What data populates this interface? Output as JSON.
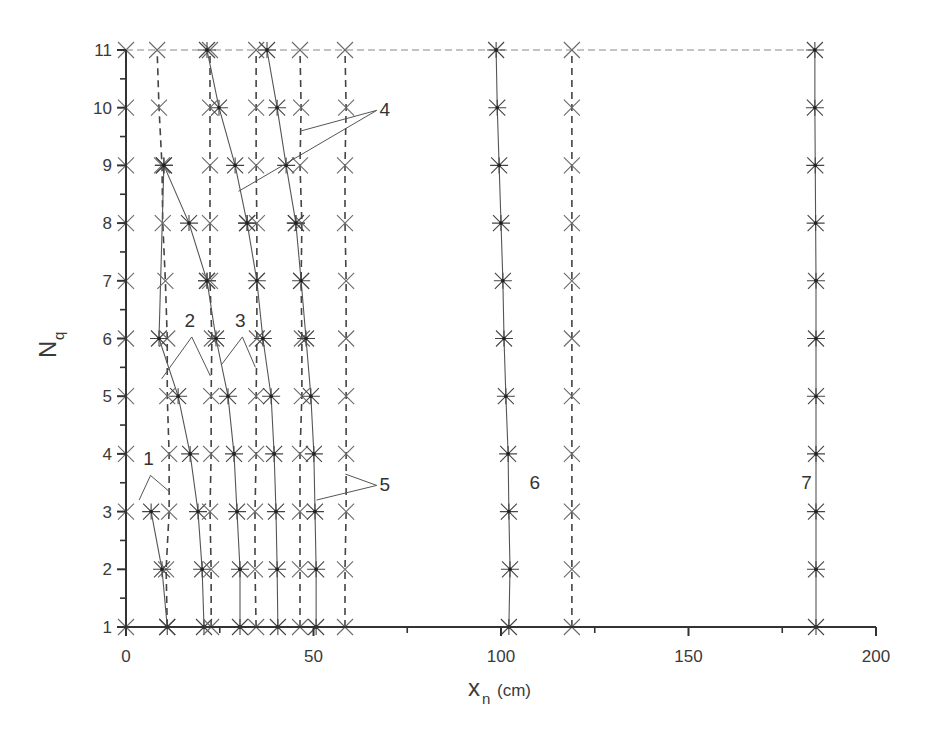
{
  "chart_data": {
    "type": "scatter",
    "title": "",
    "xlabel": "x_n (cm)",
    "xlabel_main": "x",
    "xlabel_sub": "n",
    "xlabel_unit": "(cm)",
    "ylabel": "N_q",
    "ylabel_main": "N",
    "ylabel_sub": "q",
    "xlim": [
      0,
      200
    ],
    "ylim": [
      1,
      11
    ],
    "x_ticks": [
      0,
      50,
      100,
      150,
      200
    ],
    "x_tick_labels": [
      "0",
      "50",
      "100",
      "150",
      "200"
    ],
    "x_minor_ticks": [
      25,
      75,
      125,
      175
    ],
    "y_ticks": [
      1,
      2,
      3,
      4,
      5,
      6,
      7,
      8,
      9,
      10,
      11
    ],
    "y_tick_labels": [
      "1",
      "2",
      "3",
      "4",
      "5",
      "6",
      "7",
      "8",
      "9",
      "10",
      "11"
    ],
    "grid": false,
    "legend": null,
    "y": [
      1,
      2,
      3,
      4,
      5,
      6,
      7,
      8,
      9,
      10,
      11
    ],
    "series": [
      {
        "name": "1 (x, dashed)",
        "marker": "x",
        "line": "dashed",
        "values": [
          11,
          10.7,
          11.5,
          11.5,
          11,
          11,
          10.5,
          9.8,
          9.6,
          8.8,
          8.3
        ]
      },
      {
        "name": "1 (*, solid)",
        "marker": "*",
        "line": "solid",
        "values": [
          11,
          9.6,
          6.7,
          null,
          null,
          null,
          null,
          null,
          null,
          null,
          null
        ]
      },
      {
        "name": "1-2 (x, axis)",
        "marker": "x",
        "line": "dashed",
        "values": [
          0,
          null,
          0,
          0,
          0,
          0,
          0,
          0,
          0,
          0,
          0
        ]
      },
      {
        "name": "2 (*, solid)",
        "marker": "*",
        "line": "solid",
        "values": [
          20.8,
          20.3,
          19.2,
          17.1,
          13.9,
          8.8,
          null,
          null,
          10.1,
          null,
          null
        ]
      },
      {
        "name": "2b (*, solid)",
        "marker": "*",
        "line": "solid",
        "values": [
          null,
          null,
          null,
          null,
          null,
          null,
          21.6,
          16.8,
          10.1,
          null,
          null
        ]
      },
      {
        "name": "2 (x, dashed)",
        "marker": "x",
        "line": "dashed",
        "values": [
          22.7,
          22.7,
          22.4,
          22.7,
          22.7,
          22.9,
          22.4,
          22.4,
          22.4,
          22.4,
          22.4
        ]
      },
      {
        "name": "3 (*, solid)",
        "marker": "*",
        "line": "solid",
        "values": [
          30.4,
          30.4,
          29.6,
          28.8,
          27.2,
          24.0,
          21.6,
          null,
          null,
          null,
          null
        ]
      },
      {
        "name": "4a (*, solid)",
        "marker": "*",
        "line": "solid",
        "values": [
          null,
          null,
          null,
          null,
          null,
          null,
          null,
          32.3,
          29.1,
          24.8,
          21.6
        ]
      },
      {
        "name": "3 (x, dashed)",
        "marker": "x",
        "line": "dashed",
        "values": [
          34.7,
          34.4,
          34.4,
          34.7,
          34.7,
          34.9,
          34.9,
          34.9,
          34.7,
          34.7,
          34.7
        ]
      },
      {
        "name": "4 (*, solid)",
        "marker": "*",
        "line": "solid",
        "values": [
          40.5,
          40.3,
          40.0,
          39.5,
          38.7,
          36.5,
          34.9,
          32.3,
          null,
          null,
          null
        ]
      },
      {
        "name": "4b (*, solid)",
        "marker": "*",
        "line": "solid",
        "values": [
          null,
          null,
          null,
          null,
          null,
          null,
          null,
          45.3,
          42.7,
          40.3,
          37.6
        ]
      },
      {
        "name": "4 (x, dashed)",
        "marker": "x",
        "line": "dashed",
        "values": [
          46.4,
          46.4,
          46.4,
          46.4,
          46.9,
          46.9,
          46.7,
          46.9,
          46.4,
          46.7,
          46.4
        ]
      },
      {
        "name": "5 (*, solid)",
        "marker": "*",
        "line": "solid",
        "values": [
          50.7,
          50.7,
          50.4,
          50.1,
          49.3,
          48.0,
          46.7,
          45.3,
          null,
          null,
          null
        ]
      },
      {
        "name": "5 (x, dashed)",
        "marker": "x",
        "line": "dashed",
        "values": [
          58.4,
          58.4,
          58.7,
          58.7,
          58.7,
          58.7,
          58.7,
          58.4,
          58.4,
          58.7,
          58.4
        ]
      },
      {
        "name": "6 (*, solid)",
        "marker": "*",
        "line": "solid",
        "values": [
          102.1,
          102.4,
          102.1,
          101.9,
          101.3,
          100.8,
          100.5,
          100.0,
          99.5,
          99.0,
          98.7
        ]
      },
      {
        "name": "6 (x, dashed)",
        "marker": "x",
        "line": "dashed",
        "values": [
          118.9,
          118.9,
          118.9,
          118.9,
          118.9,
          118.9,
          118.9,
          118.9,
          118.9,
          118.9,
          118.9
        ]
      },
      {
        "name": "7 (*, solid)",
        "marker": "*",
        "line": "solid",
        "values": [
          184.0,
          184.0,
          184.0,
          184.0,
          184.0,
          184.0,
          184.0,
          183.9,
          183.8,
          183.7,
          183.7
        ]
      }
    ],
    "top_dashed_line": {
      "y": 11,
      "x_from": 0,
      "x_to": 184
    },
    "annotations": [
      {
        "text": "1",
        "x": 6,
        "y": 3.8,
        "targets": [
          [
            3.5,
            3.2
          ],
          [
            11.5,
            3.35
          ]
        ]
      },
      {
        "text": "2",
        "x": 17,
        "y": 6.2,
        "targets": [
          [
            9.5,
            5.3
          ],
          [
            22.5,
            5.35
          ]
        ]
      },
      {
        "text": "3",
        "x": 30.5,
        "y": 6.2,
        "targets": [
          [
            25.5,
            5.55
          ],
          [
            34.5,
            5.5
          ]
        ]
      },
      {
        "text": "4",
        "x": 69,
        "y": 9.85,
        "targets": [
          [
            30.0,
            8.55
          ],
          [
            46.8,
            9.6
          ]
        ]
      },
      {
        "text": "5",
        "x": 69,
        "y": 3.35,
        "targets": [
          [
            50.8,
            3.2
          ],
          [
            58.5,
            3.65
          ]
        ]
      },
      {
        "text": "6",
        "x": 109,
        "y": 3.4,
        "targets": []
      },
      {
        "text": "7",
        "x": 181.5,
        "y": 3.4,
        "targets": []
      }
    ]
  },
  "colors": {
    "axis": "#333333",
    "marker_x": "#6b6b6b",
    "marker_star": "#444444",
    "line_solid": "#555555",
    "line_dashed": "#444444",
    "text": "#3a3a3a"
  }
}
